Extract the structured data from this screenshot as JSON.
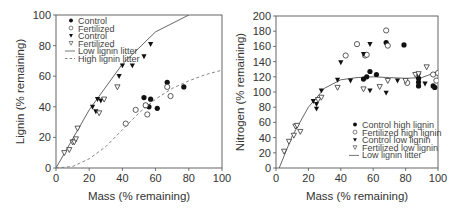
{
  "chart_data": [
    {
      "type": "scatter",
      "title": "",
      "xlabel": "Mass (% remaining)",
      "ylabel": "Lignin (% remaining)",
      "xlim": [
        0,
        100
      ],
      "ylim": [
        0,
        100
      ],
      "xticks": [
        0,
        20,
        40,
        60,
        80,
        100
      ],
      "yticks": [
        0,
        20,
        40,
        60,
        80,
        100
      ],
      "grid": false,
      "legend_position": "upper left",
      "series": [
        {
          "name": "Control",
          "marker": "filled-circle",
          "points": [
            [
              53,
              46
            ],
            [
              54,
              41
            ],
            [
              56,
              40
            ],
            [
              57,
              45
            ],
            [
              61,
              39
            ],
            [
              67,
              56
            ],
            [
              77,
              53
            ]
          ]
        },
        {
          "name": "Fertilized",
          "marker": "open-circle",
          "points": [
            [
              42,
              29
            ],
            [
              48,
              38
            ],
            [
              54,
              41
            ],
            [
              55,
              35
            ],
            [
              67,
              53
            ],
            [
              69,
              47
            ]
          ]
        },
        {
          "name": "Control",
          "marker": "filled-triangle-down",
          "points": [
            [
              22,
              40
            ],
            [
              24,
              37
            ],
            [
              25,
              45
            ],
            [
              27,
              44
            ],
            [
              38,
              60
            ],
            [
              40,
              67
            ],
            [
              46,
              67
            ],
            [
              53,
              73
            ],
            [
              57,
              81
            ]
          ]
        },
        {
          "name": "Fertilized",
          "marker": "open-triangle-down",
          "points": [
            [
              5,
              10
            ],
            [
              8,
              12
            ],
            [
              10,
              17
            ],
            [
              11,
              17
            ],
            [
              12,
              19
            ],
            [
              13,
              26
            ],
            [
              26,
              36
            ],
            [
              29,
              45
            ],
            [
              37,
              53
            ]
          ]
        },
        {
          "name": "Low lignin litter",
          "style": "solid-line",
          "points": [
            [
              0,
              0
            ],
            [
              20,
              38
            ],
            [
              40,
              68
            ],
            [
              60,
              89
            ],
            [
              80,
              100
            ]
          ]
        },
        {
          "name": "High lignin litter",
          "style": "dashed-line",
          "points": [
            [
              0,
              0
            ],
            [
              10,
              1
            ],
            [
              20,
              6
            ],
            [
              30,
              14
            ],
            [
              40,
              25
            ],
            [
              50,
              36
            ],
            [
              60,
              45
            ],
            [
              70,
              52
            ],
            [
              80,
              57
            ],
            [
              90,
              61
            ],
            [
              100,
              64
            ]
          ]
        }
      ]
    },
    {
      "type": "scatter",
      "title": "",
      "xlabel": "Mass (% remaining)",
      "ylabel": "Nitrogen (% remaining)",
      "xlim": [
        0,
        100
      ],
      "ylim": [
        0,
        200
      ],
      "xticks": [
        0,
        20,
        40,
        60,
        80,
        100
      ],
      "yticks": [
        0,
        20,
        40,
        60,
        80,
        100,
        120,
        140,
        160,
        180,
        200
      ],
      "grid": false,
      "legend_position": "lower right",
      "series": [
        {
          "name": "Control high lignin",
          "marker": "filled-circle",
          "points": [
            [
              54,
              117
            ],
            [
              56,
              120
            ],
            [
              58,
              127
            ],
            [
              62,
              123
            ],
            [
              68,
              165
            ],
            [
              79,
              162
            ],
            [
              88,
              118
            ],
            [
              88,
              113
            ],
            [
              88,
              108
            ],
            [
              97,
              108
            ],
            [
              98,
              106
            ]
          ]
        },
        {
          "name": "Fertilized high lignin",
          "marker": "open-circle",
          "points": [
            [
              43,
              148
            ],
            [
              50,
              163
            ],
            [
              55,
              148
            ],
            [
              56,
              149
            ],
            [
              68,
              181
            ],
            [
              69,
              161
            ],
            [
              81,
              112
            ],
            [
              97,
              123
            ],
            [
              99,
              115
            ],
            [
              100,
              125
            ]
          ]
        },
        {
          "name": "Control low lignin",
          "marker": "filled-triangle-down",
          "points": [
            [
              23,
              88
            ],
            [
              25,
              78
            ],
            [
              25,
              84
            ],
            [
              28,
              102
            ],
            [
              38,
              116
            ],
            [
              40,
              139
            ],
            [
              46,
              115
            ],
            [
              54,
              150
            ],
            [
              58,
              163
            ],
            [
              58,
              102
            ],
            [
              68,
              99
            ],
            [
              75,
              115
            ],
            [
              88,
              122
            ],
            [
              92,
              111
            ]
          ]
        },
        {
          "name": "Fertilized low lignin",
          "marker": "open-triangle-down",
          "points": [
            [
              5,
              22
            ],
            [
              8,
              35
            ],
            [
              11,
              43
            ],
            [
              12,
              55
            ],
            [
              13,
              56
            ],
            [
              15,
              48
            ],
            [
              26,
              90
            ],
            [
              28,
              93
            ],
            [
              38,
              106
            ],
            [
              54,
              104
            ],
            [
              64,
              107
            ],
            [
              69,
              115
            ],
            [
              80,
              115
            ],
            [
              86,
              123
            ],
            [
              88,
              124
            ],
            [
              93,
              133
            ]
          ]
        },
        {
          "name": "Low lignin litter",
          "style": "solid-line",
          "points": [
            [
              2,
              0
            ],
            [
              10,
              42
            ],
            [
              20,
              80
            ],
            [
              30,
              105
            ],
            [
              40,
              116
            ],
            [
              50,
              119
            ],
            [
              60,
              120
            ],
            [
              70,
              119
            ],
            [
              80,
              118
            ],
            [
              90,
              119
            ],
            [
              100,
              127
            ]
          ]
        }
      ]
    }
  ],
  "legend_left": {
    "items": [
      "Control",
      "Fertilized",
      "Control",
      "Fertilized",
      "Low lignin litter",
      "High lignin litter"
    ]
  },
  "legend_right": {
    "items": [
      "Control high lignin",
      "Fertilized high lignin",
      "Control low lignin",
      "Fertilized low lignin",
      "Low lignin litter"
    ]
  },
  "axes": {
    "left": {
      "xlabel": "Mass (% remaining)",
      "ylabel": "Lignin (% remaining)"
    },
    "right": {
      "xlabel": "Mass (% remaining)",
      "ylabel": "Nitrogen (% remaining)"
    }
  }
}
